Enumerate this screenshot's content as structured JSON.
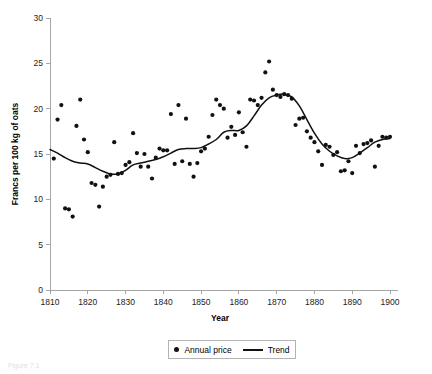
{
  "figure": {
    "caption": "Figure 7.1"
  },
  "legend": {
    "position": "bottom-center",
    "entries": [
      {
        "label": "Annual price",
        "marker": "dot"
      },
      {
        "label": "Trend",
        "marker": "line"
      }
    ]
  },
  "chart_data": {
    "type": "scatter",
    "title": "",
    "subtitle": "",
    "xlabel": "Year",
    "ylabel": "Francs per 100 kg of oats",
    "xlim": [
      1810,
      1900
    ],
    "ylim": [
      0,
      30
    ],
    "xticks": [
      1810,
      1820,
      1830,
      1840,
      1850,
      1860,
      1870,
      1880,
      1890,
      1900
    ],
    "yticks": [
      0,
      5,
      10,
      15,
      20,
      25,
      30
    ],
    "grid": false,
    "series": [
      {
        "name": "Annual price",
        "type": "scatter",
        "marker_color": "#111111",
        "x": [
          1811,
          1812,
          1813,
          1814,
          1815,
          1816,
          1817,
          1818,
          1819,
          1820,
          1821,
          1822,
          1823,
          1824,
          1825,
          1826,
          1827,
          1828,
          1829,
          1830,
          1831,
          1832,
          1833,
          1834,
          1835,
          1836,
          1837,
          1838,
          1839,
          1840,
          1841,
          1842,
          1843,
          1844,
          1845,
          1846,
          1847,
          1848,
          1849,
          1850,
          1851,
          1852,
          1853,
          1854,
          1855,
          1856,
          1857,
          1858,
          1859,
          1860,
          1861,
          1862,
          1863,
          1864,
          1865,
          1866,
          1867,
          1868,
          1869,
          1870,
          1871,
          1872,
          1873,
          1874,
          1875,
          1876,
          1877,
          1878,
          1879,
          1880,
          1881,
          1882,
          1883,
          1884,
          1885,
          1886,
          1887,
          1888,
          1889,
          1890,
          1891,
          1892,
          1893,
          1894,
          1895,
          1896,
          1897,
          1898,
          1899,
          1900
        ],
        "y": [
          14.5,
          18.8,
          20.4,
          9.0,
          8.9,
          8.1,
          18.1,
          21.0,
          16.6,
          15.2,
          11.8,
          11.6,
          9.2,
          11.4,
          12.5,
          12.7,
          16.3,
          12.8,
          12.9,
          13.8,
          14.1,
          17.3,
          15.1,
          13.6,
          15.0,
          13.6,
          12.3,
          14.6,
          15.6,
          15.4,
          15.4,
          19.4,
          13.9,
          20.4,
          14.2,
          18.9,
          13.9,
          12.5,
          14.0,
          15.3,
          15.6,
          16.9,
          19.3,
          21.0,
          20.4,
          20.0,
          16.8,
          18.0,
          17.1,
          19.6,
          17.4,
          15.8,
          21.0,
          20.9,
          20.4,
          21.2,
          24.0,
          25.2,
          22.1,
          21.5,
          21.3,
          21.6,
          21.5,
          21.1,
          18.2,
          18.9,
          19.0,
          17.5,
          16.8,
          16.3,
          15.3,
          13.8,
          16.0,
          15.8,
          14.9,
          15.2,
          13.1,
          13.2,
          14.2,
          12.9,
          15.9,
          15.1,
          16.1,
          16.2,
          16.5,
          13.6,
          15.9,
          16.9,
          16.8,
          16.9
        ]
      },
      {
        "name": "Trend",
        "type": "line",
        "line_color": "#111111",
        "x": [
          1810,
          1812,
          1814,
          1816,
          1818,
          1820,
          1822,
          1824,
          1826,
          1828,
          1830,
          1832,
          1834,
          1836,
          1838,
          1840,
          1842,
          1844,
          1846,
          1848,
          1850,
          1852,
          1854,
          1856,
          1858,
          1860,
          1862,
          1864,
          1866,
          1868,
          1870,
          1872,
          1874,
          1876,
          1878,
          1880,
          1882,
          1884,
          1886,
          1888,
          1890,
          1892,
          1894,
          1896,
          1898,
          1900
        ],
        "y": [
          15.5,
          15.1,
          14.6,
          14.2,
          14.0,
          13.9,
          13.5,
          13.1,
          12.8,
          12.8,
          13.2,
          13.8,
          14.0,
          14.2,
          14.4,
          14.7,
          15.1,
          15.5,
          15.6,
          15.6,
          15.7,
          16.1,
          16.6,
          17.4,
          17.6,
          17.6,
          18.1,
          19.2,
          20.4,
          21.2,
          21.5,
          21.6,
          21.3,
          20.3,
          18.8,
          17.3,
          16.1,
          15.3,
          14.8,
          14.5,
          14.6,
          15.1,
          15.7,
          16.3,
          16.6,
          16.7
        ]
      }
    ]
  }
}
